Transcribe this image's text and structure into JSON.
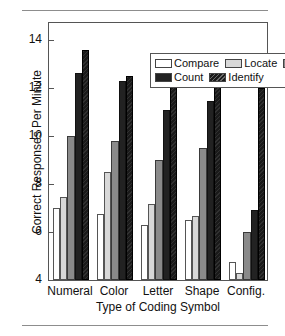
{
  "chart_data": {
    "type": "bar",
    "title": "",
    "xlabel": "Type of Coding Symbol",
    "ylabel": "Correct Responses Per Minute",
    "categories": [
      "Numeral",
      "Color",
      "Letter",
      "Shape",
      "Config."
    ],
    "series": [
      {
        "name": "Compare",
        "color": "#ffffff",
        "values": [
          7.0,
          6.75,
          6.3,
          6.5,
          4.75
        ]
      },
      {
        "name": "Locate",
        "color": "#d8d8d8",
        "values": [
          7.45,
          8.5,
          7.15,
          6.65,
          4.3
        ]
      },
      {
        "name": "Verify",
        "color": "#8a8a8a",
        "values": [
          10.0,
          9.8,
          9.0,
          9.5,
          6.0
        ]
      },
      {
        "name": "Count",
        "color": "#222222",
        "values": [
          12.65,
          12.3,
          11.1,
          11.45,
          6.9
        ]
      },
      {
        "name": "Identify",
        "color": "#1a1a1a",
        "values": [
          13.6,
          12.5,
          13.0,
          12.45,
          12.0
        ]
      }
    ],
    "ylim": [
      4,
      14.8
    ],
    "yticks": [
      4,
      6,
      8,
      10,
      12,
      14
    ],
    "ytick_labels": [
      "4",
      "6",
      "8",
      "10",
      "12",
      "14"
    ],
    "grid": false,
    "legend_position": "top-right-inside",
    "legend_rows": [
      [
        "Compare",
        "Locate",
        "Verify"
      ],
      [
        "Count",
        "Identify"
      ]
    ]
  },
  "figure": {
    "rule_top": "horizontal-rule",
    "rule_bottom": "horizontal-rule"
  }
}
